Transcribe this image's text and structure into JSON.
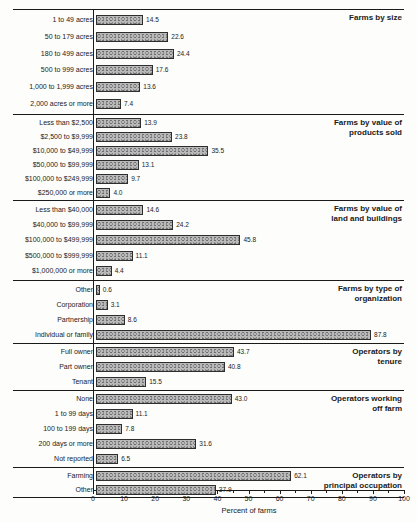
{
  "chart_data": {
    "type": "bar",
    "orientation": "horizontal",
    "title": "",
    "xlabel": "Percent of farms",
    "ylabel": "",
    "xlim": [
      0,
      100
    ],
    "x_major_ticks": [
      0,
      10,
      20,
      30,
      40,
      50,
      60,
      70,
      80,
      90,
      100
    ],
    "x_minor_ticks": [
      5,
      15,
      25,
      35,
      45,
      55,
      65,
      75,
      85,
      95
    ],
    "grid": false,
    "legend": "none",
    "bar_fill_color": "#b9b9b9",
    "bar_border_color": "#2e2e2e",
    "sections": [
      {
        "title_lines": [
          "Farms by size"
        ],
        "rows": [
          {
            "label": "1 to 49 acres",
            "value": 14.5,
            "display": "14.5"
          },
          {
            "label": "50 to 179 acres",
            "value": 22.6,
            "display": "22.6"
          },
          {
            "label": "180 to 499 acres",
            "value": 24.4,
            "display": "24.4"
          },
          {
            "label": "500 to 999 acres",
            "value": 17.6,
            "display": "17.6"
          },
          {
            "label": "1,000 to 1,999 acres",
            "value": 13.6,
            "display": "13.6"
          },
          {
            "label": "2,000 acres or more",
            "value": 7.4,
            "display": "7.4"
          }
        ]
      },
      {
        "title_lines": [
          "Farms by value of",
          "products sold"
        ],
        "rows": [
          {
            "label": "Less than $2,500",
            "value": 13.9,
            "display": "13.9"
          },
          {
            "label": "$2,500 to $9,999",
            "value": 23.8,
            "display": "23.8"
          },
          {
            "label": "$10,000 to $49,999",
            "value": 35.5,
            "display": "35.5"
          },
          {
            "label": "$50,000 to $99,999",
            "value": 13.1,
            "display": "13.1"
          },
          {
            "label": "$100,000 to $249,999",
            "value": 9.7,
            "display": "9.7"
          },
          {
            "label": "$250,000 or more",
            "value": 4.0,
            "display": "4.0"
          }
        ]
      },
      {
        "title_lines": [
          "Farms by value of",
          "land and buildings"
        ],
        "rows": [
          {
            "label": "Less than $40,000",
            "value": 14.6,
            "display": "14.6"
          },
          {
            "label": "$40,000 to $99,999",
            "value": 24.2,
            "display": "24.2"
          },
          {
            "label": "$100,000 to $499,999",
            "value": 45.8,
            "display": "45.8"
          },
          {
            "label": "$500,000 to $999,999",
            "value": 11.1,
            "display": "11.1"
          },
          {
            "label": "$1,000,000 or more",
            "value": 4.4,
            "display": "4.4"
          }
        ]
      },
      {
        "title_lines": [
          "Farms by type of",
          "organization"
        ],
        "rows": [
          {
            "label": "Other",
            "value": 0.6,
            "display": "0.6"
          },
          {
            "label": "Corporation",
            "value": 3.1,
            "display": "3.1"
          },
          {
            "label": "Partnership",
            "value": 8.6,
            "display": "8.6"
          },
          {
            "label": "Individual or family",
            "value": 87.8,
            "display": "87.8"
          }
        ]
      },
      {
        "title_lines": [
          "Operators by",
          "tenure"
        ],
        "rows": [
          {
            "label": "Full owner",
            "value": 43.7,
            "display": "43.7"
          },
          {
            "label": "Part owner",
            "value": 40.8,
            "display": "40.8"
          },
          {
            "label": "Tenant",
            "value": 15.5,
            "display": "15.5"
          }
        ]
      },
      {
        "title_lines": [
          "Operators working",
          "off farm"
        ],
        "rows": [
          {
            "label": "None",
            "value": 43.0,
            "display": "43.0"
          },
          {
            "label": "1 to 99 days",
            "value": 11.1,
            "display": "11.1"
          },
          {
            "label": "100 to 199 days",
            "value": 7.8,
            "display": "7.8"
          },
          {
            "label": "200 days or more",
            "value": 31.6,
            "display": "31.6"
          },
          {
            "label": "Not reported",
            "value": 6.5,
            "display": "6.5"
          }
        ]
      },
      {
        "title_lines": [
          "Operators by",
          "principal occupation"
        ],
        "rows": [
          {
            "label": "Farming",
            "value": 62.1,
            "display": "62.1"
          },
          {
            "label": "Other",
            "value": 37.9,
            "display": "37.9"
          }
        ]
      }
    ]
  }
}
